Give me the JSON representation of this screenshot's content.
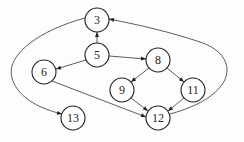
{
  "diagram": {
    "type": "directed-graph",
    "nodes": [
      {
        "id": "3",
        "label": "3",
        "x": 97,
        "y": 20
      },
      {
        "id": "5",
        "label": "5",
        "x": 97,
        "y": 55
      },
      {
        "id": "6",
        "label": "6",
        "x": 44,
        "y": 72
      },
      {
        "id": "8",
        "label": "8",
        "x": 158,
        "y": 60
      },
      {
        "id": "9",
        "label": "9",
        "x": 122,
        "y": 90
      },
      {
        "id": "11",
        "label": "11",
        "x": 193,
        "y": 90
      },
      {
        "id": "12",
        "label": "12",
        "x": 158,
        "y": 118
      },
      {
        "id": "13",
        "label": "13",
        "x": 73,
        "y": 118
      }
    ],
    "edges": [
      {
        "from": "5",
        "to": "3"
      },
      {
        "from": "5",
        "to": "6"
      },
      {
        "from": "5",
        "to": "8"
      },
      {
        "from": "8",
        "to": "9"
      },
      {
        "from": "8",
        "to": "11"
      },
      {
        "from": "9",
        "to": "12"
      },
      {
        "from": "11",
        "to": "12"
      },
      {
        "from": "6",
        "to": "12"
      },
      {
        "from": "12",
        "to": "3"
      },
      {
        "from": "3",
        "to": "13"
      }
    ]
  }
}
